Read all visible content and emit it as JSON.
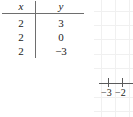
{
  "figure": {
    "background_color": "#ffffff",
    "ink_color": "#1a1a1a",
    "rule_color": "#6e6e6e",
    "grid_color": "#f0f0f0",
    "axis_color": "#5a5a5a"
  },
  "table": {
    "headers": {
      "x": "x",
      "y": "y"
    },
    "rows": [
      {
        "x": "2",
        "y": "3"
      },
      {
        "x": "2",
        "y": "0"
      },
      {
        "x": "2",
        "y": "−3"
      }
    ]
  },
  "graph": {
    "x_tick_labels": [
      "−3",
      "−2"
    ],
    "grid": "on",
    "axis": "x-axis"
  }
}
